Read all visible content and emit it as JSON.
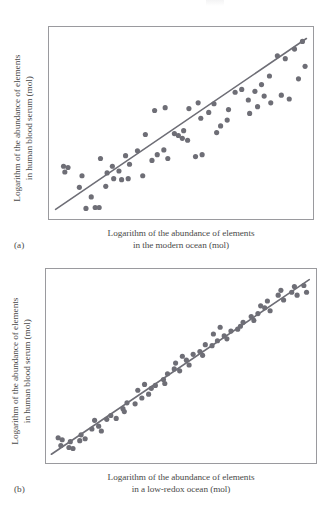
{
  "figure": {
    "caption_tag_a": "(a)",
    "caption_tag_b": "(b)",
    "accent_color": "#6e6e76",
    "frame_color": "#9a9a9e",
    "text_color": "#4a4a4a",
    "background_color": "#ffffff"
  },
  "panel_a": {
    "tag": "(a)",
    "ylabel_line1": "Logarithm of the abundance of elements",
    "ylabel_line2": "in human blood serum (mol)",
    "xlabel_line1": "Logarithm of the abundance of elements",
    "xlabel_line2": "in the modern ocean (mol)"
  },
  "panel_b": {
    "tag": "(b)",
    "ylabel_line1": "Logarithm of the abundance of elements",
    "ylabel_line2": "in human blood serum (mol)",
    "xlabel_line1": "Logarithm of the abundance of elements",
    "xlabel_line2": "in a low-redox ocean (mol)"
  },
  "chart_data": [
    {
      "type": "scatter",
      "id": "panel-a",
      "title": "",
      "xlabel": "Logarithm of the abundance of elements in the modern ocean (mol)",
      "ylabel": "Logarithm of the abundance of elements in human blood serum (mol)",
      "xlim": [
        0,
        100
      ],
      "ylim": [
        0,
        100
      ],
      "grid": false,
      "legend": "none",
      "axis_ticks": false,
      "marker_color": "#6e6e76",
      "marker_radius": 2.6,
      "trendline": {
        "color": "#6e6e76",
        "width": 1.6,
        "x": [
          2.5,
          97.5
        ],
        "y": [
          5.0,
          94.0
        ]
      },
      "points": [
        [
          5.5,
          27.5
        ],
        [
          7.2,
          26.8
        ],
        [
          6.0,
          24.5
        ],
        [
          11.5,
          16.5
        ],
        [
          14.0,
          5.5
        ],
        [
          17.5,
          6.0
        ],
        [
          19.0,
          6.0
        ],
        [
          16.0,
          11.5
        ],
        [
          21.5,
          17.0
        ],
        [
          19.5,
          31.5
        ],
        [
          24.5,
          21.0
        ],
        [
          27.5,
          20.5
        ],
        [
          30.0,
          21.0
        ],
        [
          26.5,
          25.0
        ],
        [
          24.0,
          27.5
        ],
        [
          33.5,
          35.5
        ],
        [
          30.5,
          28.5
        ],
        [
          35.5,
          22.5
        ],
        [
          36.5,
          44.0
        ],
        [
          39.0,
          30.5
        ],
        [
          41.0,
          33.5
        ],
        [
          43.5,
          36.0
        ],
        [
          45.0,
          31.5
        ],
        [
          47.5,
          44.5
        ],
        [
          49.0,
          43.5
        ],
        [
          50.5,
          42.0
        ],
        [
          52.5,
          41.0
        ],
        [
          51.0,
          46.0
        ],
        [
          55.5,
          32.5
        ],
        [
          58.0,
          33.5
        ],
        [
          60.5,
          55.5
        ],
        [
          57.5,
          52.5
        ],
        [
          56.5,
          60.5
        ],
        [
          62.5,
          60.0
        ],
        [
          65.0,
          48.5
        ],
        [
          63.5,
          45.0
        ],
        [
          67.5,
          51.5
        ],
        [
          70.5,
          66.0
        ],
        [
          68.0,
          57.0
        ],
        [
          73.0,
          67.5
        ],
        [
          75.5,
          62.0
        ],
        [
          78.0,
          66.5
        ],
        [
          76.0,
          55.0
        ],
        [
          80.5,
          70.0
        ],
        [
          79.0,
          58.5
        ],
        [
          83.5,
          74.5
        ],
        [
          81.5,
          64.0
        ],
        [
          86.5,
          85.0
        ],
        [
          84.0,
          60.5
        ],
        [
          89.5,
          83.5
        ],
        [
          88.0,
          64.5
        ],
        [
          91.0,
          62.5
        ],
        [
          93.0,
          88.5
        ],
        [
          94.5,
          73.0
        ],
        [
          96.0,
          92.5
        ],
        [
          97.0,
          79.5
        ],
        [
          44.0,
          58.0
        ],
        [
          40.0,
          56.5
        ],
        [
          53.0,
          57.5
        ],
        [
          29.0,
          33.0
        ],
        [
          22.0,
          24.0
        ],
        [
          12.5,
          22.5
        ]
      ]
    },
    {
      "type": "scatter",
      "id": "panel-b",
      "title": "",
      "xlabel": "Logarithm of the abundance of elements in a low-redox ocean (mol)",
      "ylabel": "Logarithm of the abundance of elements in human blood serum (mol)",
      "xlim": [
        0,
        100
      ],
      "ylim": [
        0,
        100
      ],
      "grid": false,
      "legend": "none",
      "axis_ticks": false,
      "marker_color": "#6e6e76",
      "marker_radius": 2.6,
      "trendline": {
        "color": "#6e6e76",
        "width": 1.6,
        "x": [
          2.0,
          97.5
        ],
        "y": [
          4.5,
          94.5
        ]
      },
      "points": [
        [
          4.5,
          13.0
        ],
        [
          6.0,
          12.0
        ],
        [
          5.5,
          9.0
        ],
        [
          8.5,
          8.0
        ],
        [
          10.0,
          7.5
        ],
        [
          9.0,
          11.0
        ],
        [
          12.5,
          11.5
        ],
        [
          14.5,
          12.5
        ],
        [
          13.0,
          14.5
        ],
        [
          17.0,
          17.5
        ],
        [
          19.5,
          19.0
        ],
        [
          18.0,
          22.0
        ],
        [
          22.5,
          22.5
        ],
        [
          24.0,
          24.5
        ],
        [
          26.0,
          23.0
        ],
        [
          28.5,
          28.0
        ],
        [
          30.0,
          31.0
        ],
        [
          29.0,
          26.5
        ],
        [
          33.0,
          30.5
        ],
        [
          35.5,
          33.5
        ],
        [
          34.0,
          37.5
        ],
        [
          38.0,
          35.5
        ],
        [
          40.5,
          40.0
        ],
        [
          39.0,
          38.5
        ],
        [
          43.5,
          43.0
        ],
        [
          45.0,
          46.0
        ],
        [
          44.0,
          41.0
        ],
        [
          47.5,
          48.5
        ],
        [
          49.5,
          47.5
        ],
        [
          48.0,
          51.5
        ],
        [
          52.0,
          53.0
        ],
        [
          54.5,
          56.0
        ],
        [
          53.0,
          50.5
        ],
        [
          57.0,
          57.5
        ],
        [
          59.0,
          61.0
        ],
        [
          58.0,
          55.5
        ],
        [
          61.5,
          60.5
        ],
        [
          63.5,
          63.0
        ],
        [
          62.0,
          66.5
        ],
        [
          66.0,
          65.5
        ],
        [
          68.5,
          68.0
        ],
        [
          67.0,
          64.0
        ],
        [
          71.0,
          69.0
        ],
        [
          73.0,
          72.5
        ],
        [
          72.0,
          70.5
        ],
        [
          76.0,
          75.5
        ],
        [
          78.5,
          77.0
        ],
        [
          77.0,
          73.5
        ],
        [
          81.0,
          80.0
        ],
        [
          83.0,
          78.5
        ],
        [
          82.0,
          83.5
        ],
        [
          86.0,
          86.5
        ],
        [
          88.0,
          84.0
        ],
        [
          87.0,
          89.0
        ],
        [
          91.0,
          88.0
        ],
        [
          93.0,
          86.5
        ],
        [
          92.0,
          91.0
        ],
        [
          95.5,
          91.5
        ],
        [
          96.5,
          88.0
        ],
        [
          20.5,
          16.5
        ],
        [
          36.5,
          40.5
        ],
        [
          50.5,
          55.0
        ],
        [
          64.5,
          70.0
        ],
        [
          79.5,
          81.0
        ]
      ]
    }
  ]
}
